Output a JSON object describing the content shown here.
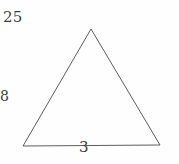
{
  "figure": {
    "kind": "triangle-graph-diagram",
    "background_color": "#fffefe",
    "edge_color": "#5d5d5d",
    "label_color": "#3e3e3e",
    "edge_width": 1,
    "vertices": [
      {
        "id": "apex",
        "label": "25",
        "x": 91,
        "y": 29,
        "label_x": 92,
        "label_y": 17
      },
      {
        "id": "bottom-left",
        "label": "5",
        "x": 23,
        "y": 146,
        "label_x": 12,
        "label_y": 147
      },
      {
        "id": "bottom-right",
        "label": "3",
        "x": 160,
        "y": 145,
        "label_x": 168,
        "label_y": 147
      }
    ],
    "edges": [
      {
        "from": "bottom-left",
        "to": "apex"
      },
      {
        "from": "apex",
        "to": "bottom-right"
      },
      {
        "from": "bottom-left",
        "to": "bottom-right"
      }
    ],
    "interior_label": {
      "text": "8",
      "x": 89,
      "y": 96
    }
  }
}
